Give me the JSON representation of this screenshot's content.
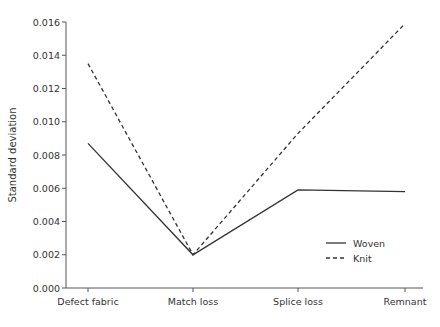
{
  "chart_data": {
    "type": "line",
    "title": "",
    "xlabel": "",
    "ylabel": "Standard deviation",
    "categories": [
      "Defect fabric",
      "Match loss",
      "Splice loss",
      "Remnant"
    ],
    "series": [
      {
        "name": "Woven",
        "style": "solid",
        "values": [
          0.0087,
          0.002,
          0.0059,
          0.0058
        ]
      },
      {
        "name": "Knit",
        "style": "dashed",
        "values": [
          0.0135,
          0.002,
          0.0093,
          0.0159
        ]
      }
    ],
    "ylim": [
      0,
      0.016
    ],
    "yticks": [
      "0.000",
      "0.002",
      "0.004",
      "0.006",
      "0.008",
      "0.010",
      "0.012",
      "0.014",
      "0.016"
    ],
    "grid": false,
    "legend_position": "lower right (inside plot)",
    "colors": {
      "line": "#333333",
      "axis": "#555555"
    }
  }
}
